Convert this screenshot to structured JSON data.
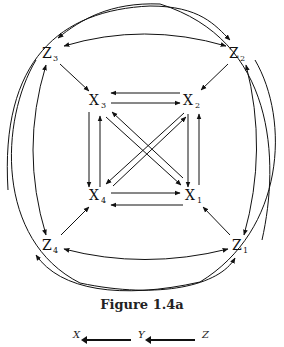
{
  "figure": {
    "caption": "Figure 1.4a",
    "nodes": [
      {
        "id": "Z3",
        "base": "Z",
        "sub": "3",
        "x": 50,
        "y": 54
      },
      {
        "id": "Z2",
        "base": "Z",
        "sub": "2",
        "x": 237,
        "y": 54
      },
      {
        "id": "X3",
        "base": "X",
        "sub": "3",
        "x": 97,
        "y": 101
      },
      {
        "id": "X2",
        "base": "X",
        "sub": "2",
        "x": 190,
        "y": 101
      },
      {
        "id": "X4",
        "base": "X",
        "sub": "4",
        "x": 97,
        "y": 196
      },
      {
        "id": "X1",
        "base": "X",
        "sub": "1",
        "x": 192,
        "y": 196
      },
      {
        "id": "Z4",
        "base": "Z",
        "sub": "4",
        "x": 50,
        "y": 246
      },
      {
        "id": "Z1",
        "base": "Z",
        "sub": "1",
        "x": 240,
        "y": 246
      }
    ],
    "edges": [
      {
        "from": "Z3",
        "to": "X3"
      },
      {
        "from": "Z2",
        "to": "X2"
      },
      {
        "from": "Z4",
        "to": "X4"
      },
      {
        "from": "Z1",
        "to": "X1"
      },
      {
        "from": "X2",
        "to": "X3"
      },
      {
        "from": "X3",
        "to": "X2"
      },
      {
        "from": "X4",
        "to": "X1"
      },
      {
        "from": "X1",
        "to": "X4"
      },
      {
        "from": "X3",
        "to": "X4"
      },
      {
        "from": "X4",
        "to": "X3"
      },
      {
        "from": "X2",
        "to": "X1"
      },
      {
        "from": "X1",
        "to": "X2"
      },
      {
        "from": "X3",
        "to": "X1"
      },
      {
        "from": "X1",
        "to": "X3"
      },
      {
        "from": "X2",
        "to": "X4"
      },
      {
        "from": "X4",
        "to": "X2"
      },
      {
        "from": "Z3",
        "to": "Z2",
        "bidirectional": true
      },
      {
        "from": "Z4",
        "to": "Z1",
        "bidirectional": true
      },
      {
        "from": "Z3",
        "to": "Z4",
        "bidirectional": true
      },
      {
        "from": "Z2",
        "to": "Z1",
        "bidirectional": true
      },
      {
        "from": "Z4",
        "to": "Z2",
        "curved_outer": true
      },
      {
        "from": "Z1",
        "to": "Z3",
        "curved_outer": true
      },
      {
        "from": "Z2",
        "to": "Z4",
        "curved_outer": true
      },
      {
        "from": "Z3",
        "to": "Z1",
        "curved_outer": true
      }
    ]
  },
  "next_figure_partial": {
    "labels": [
      "X",
      "Y",
      "Z"
    ]
  }
}
